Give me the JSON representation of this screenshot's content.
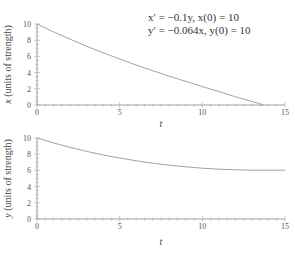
{
  "equations": {
    "line1": "x′ = −0.1y,    x(0) = 10",
    "line2": "y′ = −0.064x,    y(0) = 10"
  },
  "chart_data": [
    {
      "type": "line",
      "title": "x′ = −0.1y, x(0) = 10; y′ = −0.064x, y(0) = 10",
      "xlabel": "t",
      "ylabel": "x (units of strength)",
      "xlim": [
        0,
        15
      ],
      "ylim": [
        0,
        10
      ],
      "xticks": [
        "0",
        "5",
        "10",
        "15"
      ],
      "yticks": [
        "0",
        "2",
        "4",
        "6",
        "8",
        "10"
      ],
      "grid": false,
      "series": [
        {
          "name": "x(t)",
          "x": [
            0,
            1,
            2,
            3,
            4,
            5,
            6,
            7,
            8,
            9,
            10,
            11,
            12,
            13,
            13.7
          ],
          "values": [
            10,
            9.03,
            8.12,
            7.26,
            6.45,
            5.68,
            4.94,
            4.24,
            3.56,
            2.91,
            2.27,
            1.67,
            1.01,
            0.44,
            0
          ]
        }
      ]
    },
    {
      "type": "line",
      "xlabel": "t",
      "ylabel": "y (units of strength)",
      "xlim": [
        0,
        15
      ],
      "ylim": [
        0,
        10
      ],
      "xticks": [
        "0",
        "5",
        "10",
        "15"
      ],
      "yticks": [
        "0",
        "2",
        "4",
        "6",
        "8",
        "10"
      ],
      "grid": false,
      "series": [
        {
          "name": "y(t)",
          "x": [
            0,
            1,
            2,
            3,
            4,
            5,
            6,
            7,
            8,
            9,
            10,
            11,
            12,
            13,
            14,
            15
          ],
          "values": [
            10,
            9.39,
            8.84,
            8.35,
            7.91,
            7.53,
            7.19,
            6.89,
            6.64,
            6.44,
            6.27,
            6.15,
            6.07,
            6.03,
            6.02,
            6.03
          ]
        }
      ]
    }
  ]
}
